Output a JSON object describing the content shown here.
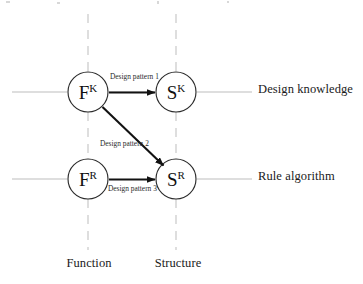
{
  "diagram": {
    "background_color": "#ffffff",
    "line_color": "#1a1a1a",
    "axis_line_color": "#c9c9c9",
    "nodes": [
      {
        "id": "fk",
        "base": "F",
        "superscript": "K",
        "label": "F K",
        "cx": 88,
        "cy": 92,
        "r": 20
      },
      {
        "id": "sk",
        "base": "S",
        "superscript": "K",
        "label": "S K",
        "cx": 176,
        "cy": 92,
        "r": 20
      },
      {
        "id": "fr",
        "base": "F",
        "superscript": "R",
        "label": "F R",
        "cx": 88,
        "cy": 179,
        "r": 20
      },
      {
        "id": "sr",
        "base": "S",
        "superscript": "R",
        "label": "S R",
        "cx": 176,
        "cy": 179,
        "r": 20
      }
    ],
    "edges": [
      {
        "id": "edge-1",
        "label": "Design pattern 1",
        "from": "fk",
        "to": "sk",
        "label_x": 110,
        "label_y": 76
      },
      {
        "id": "edge-2",
        "label": "Design pattern 2",
        "from": "fk",
        "to": "sr",
        "label_x": 100,
        "label_y": 143
      },
      {
        "id": "edge-3",
        "label": "Design pattern 3",
        "from": "fr",
        "to": "sr",
        "label_x": 108,
        "label_y": 197
      }
    ],
    "row_labels": [
      {
        "id": "row-k",
        "text": "Design knowledge"
      },
      {
        "id": "row-r",
        "text": "Rule algorithm"
      }
    ],
    "column_labels": [
      {
        "id": "col-function",
        "text": "Function"
      },
      {
        "id": "col-structure",
        "text": "Structure"
      }
    ]
  }
}
